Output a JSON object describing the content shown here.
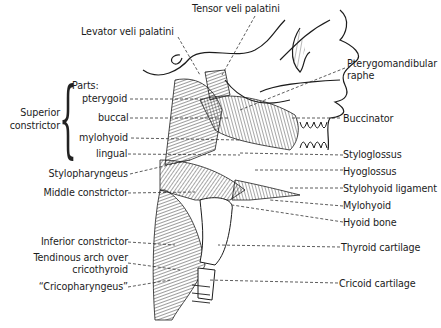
{
  "figure": {
    "labels_top": [
      {
        "id": "tensor",
        "text": "Tensor veli palatini"
      },
      {
        "id": "levator",
        "text": "Levator veli palatini"
      }
    ],
    "superior_constrictor": {
      "group_label_line1": "Superior",
      "group_label_line2": "constrictor",
      "parts_heading": "Parts:",
      "parts": [
        {
          "id": "pterygoid",
          "text": "pterygoid"
        },
        {
          "id": "buccal",
          "text": "buccal"
        },
        {
          "id": "mylohyoid_part",
          "text": "mylohyoid"
        },
        {
          "id": "lingual",
          "text": "lingual"
        }
      ]
    },
    "labels_left": [
      {
        "id": "stylopharyngeus",
        "text": "Stylopharyngeus"
      },
      {
        "id": "middle_constrictor",
        "text": "Middle constrictor"
      },
      {
        "id": "inferior_constrictor",
        "text": "Inferior constrictor"
      },
      {
        "id": "tendinous_arch_1",
        "text": "Tendinous arch over"
      },
      {
        "id": "tendinous_arch_2",
        "text": "cricothyroid"
      },
      {
        "id": "cricopharyngeus",
        "text": "“Cricopharyngeus”"
      }
    ],
    "labels_right": [
      {
        "id": "ptery_raphe_1",
        "text": "Pterygomandibular"
      },
      {
        "id": "ptery_raphe_2",
        "text": "raphe"
      },
      {
        "id": "buccinator",
        "text": "Buccinator"
      },
      {
        "id": "styloglossus",
        "text": "Styloglossus"
      },
      {
        "id": "hyoglossus",
        "text": "Hyoglossus"
      },
      {
        "id": "stylohyoid_lig",
        "text": "Stylohyoid ligament"
      },
      {
        "id": "mylohyoid",
        "text": "Mylohyoid"
      },
      {
        "id": "hyoid_bone",
        "text": "Hyoid bone"
      },
      {
        "id": "thyroid_cart",
        "text": "Thyroid cartilage"
      },
      {
        "id": "cricoid_cart",
        "text": "Cricoid cartilage"
      }
    ],
    "colors": {
      "ink": "#1c1c1c",
      "background": "#ffffff"
    }
  }
}
